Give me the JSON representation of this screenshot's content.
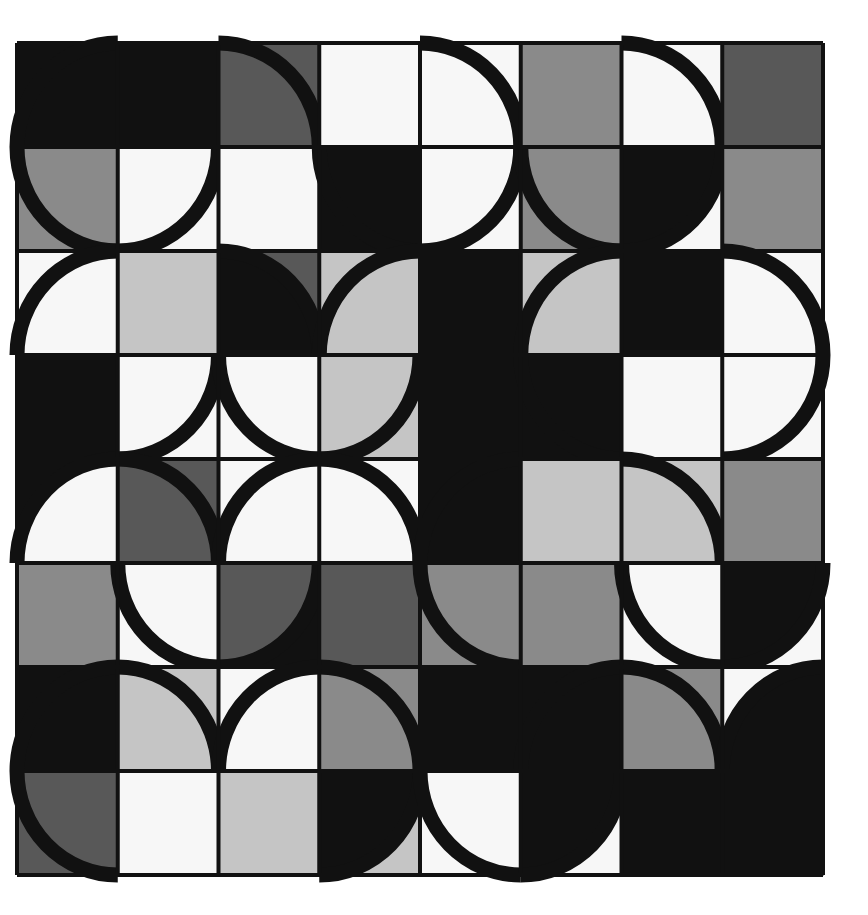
{
  "artwork": {
    "title": "Abstract Geometric Quarter-Circle Grid",
    "medium": "flat-color geometric composition",
    "canvas": {
      "width": 868,
      "height": 915,
      "background": "#ffffff"
    },
    "grid": {
      "origin_x": 17,
      "origin_y": 43,
      "width": 806,
      "height": 832,
      "cols": 8,
      "rows": 8,
      "cell_w": 100.75,
      "cell_h": 104.0
    },
    "stroke": {
      "color": "#111111",
      "width": 15,
      "gridline_color": "#111111",
      "gridline_width": 4
    },
    "palette": {
      "black": "#111111",
      "dark_gray": "#585858",
      "mid_gray": "#8a8a8a",
      "light_gray": "#c5c5c5",
      "pale": "#e9e9e9",
      "white": "#f7f7f7",
      "pure_white": "#ffffff"
    },
    "palette_names": [
      "black",
      "dark_gray",
      "mid_gray",
      "light_gray",
      "pale",
      "white"
    ],
    "legend": [
      {
        "swatch": "black",
        "hex": "#111111",
        "label": "Black"
      },
      {
        "swatch": "dark_gray",
        "hex": "#585858",
        "label": "Dark Gray"
      },
      {
        "swatch": "mid_gray",
        "hex": "#8a8a8a",
        "label": "Mid Gray"
      },
      {
        "swatch": "light_gray",
        "hex": "#c5c5c5",
        "label": "Light Gray"
      },
      {
        "swatch": "pale",
        "hex": "#e9e9e9",
        "label": "Pale Gray"
      },
      {
        "swatch": "white",
        "hex": "#f7f7f7",
        "label": "White"
      }
    ],
    "cells": [
      [
        {
          "bg": "black",
          "arc": "tl",
          "mode": "stroke"
        },
        {
          "bg": "black",
          "arc": "none",
          "mode": "none"
        },
        {
          "bg": "dark_gray",
          "arc": "tr",
          "mode": "stroke"
        },
        {
          "bg": "white",
          "arc": "none",
          "mode": "none"
        },
        {
          "bg": "white",
          "arc": "tr",
          "mode": "stroke"
        },
        {
          "bg": "mid_gray",
          "arc": "none",
          "mode": "none"
        },
        {
          "bg": "white",
          "arc": "tr",
          "mode": "stroke"
        },
        {
          "bg": "dark_gray",
          "arc": "none",
          "mode": "none"
        }
      ],
      [
        {
          "bg": "mid_gray",
          "arc": "bl",
          "mode": "stroke"
        },
        {
          "bg": "white",
          "arc": "br",
          "mode": "stroke"
        },
        {
          "bg": "white",
          "arc": "none",
          "mode": "none"
        },
        {
          "bg": "black",
          "arc": "bl",
          "mode": "stroke"
        },
        {
          "bg": "white",
          "arc": "br",
          "mode": "stroke"
        },
        {
          "bg": "mid_gray",
          "arc": "bl",
          "mode": "stroke"
        },
        {
          "bg": "black",
          "arc": "br",
          "mode": "fill_white"
        },
        {
          "bg": "mid_gray",
          "arc": "none",
          "mode": "none"
        }
      ],
      [
        {
          "bg": "white",
          "arc": "tl",
          "mode": "stroke"
        },
        {
          "bg": "light_gray",
          "arc": "none",
          "mode": "none"
        },
        {
          "bg": "black",
          "arc": "tr",
          "mode": "fill_dark"
        },
        {
          "bg": "light_gray",
          "arc": "tl",
          "mode": "stroke"
        },
        {
          "bg": "black",
          "arc": "none",
          "mode": "none"
        },
        {
          "bg": "light_gray",
          "arc": "tl",
          "mode": "stroke"
        },
        {
          "bg": "black",
          "arc": "none",
          "mode": "none"
        },
        {
          "bg": "white",
          "arc": "tr",
          "mode": "stroke"
        }
      ],
      [
        {
          "bg": "black",
          "arc": "none",
          "mode": "none"
        },
        {
          "bg": "white",
          "arc": "br",
          "mode": "stroke"
        },
        {
          "bg": "white",
          "arc": "bl",
          "mode": "stroke"
        },
        {
          "bg": "light_gray",
          "arc": "br",
          "mode": "stroke"
        },
        {
          "bg": "black",
          "arc": "none",
          "mode": "none"
        },
        {
          "bg": "black",
          "arc": "bl",
          "mode": "stroke"
        },
        {
          "bg": "white",
          "arc": "none",
          "mode": "none"
        },
        {
          "bg": "white",
          "arc": "br",
          "mode": "stroke"
        }
      ],
      [
        {
          "bg": "white",
          "arc": "tl",
          "mode": "fill_black"
        },
        {
          "bg": "dark_gray",
          "arc": "tr",
          "mode": "stroke"
        },
        {
          "bg": "white",
          "arc": "tl",
          "mode": "stroke"
        },
        {
          "bg": "white",
          "arc": "tr",
          "mode": "stroke"
        },
        {
          "bg": "black",
          "arc": "tl",
          "mode": "stroke"
        },
        {
          "bg": "light_gray",
          "arc": "none",
          "mode": "none"
        },
        {
          "bg": "light_gray",
          "arc": "tr",
          "mode": "stroke"
        },
        {
          "bg": "mid_gray",
          "arc": "none",
          "mode": "none"
        }
      ],
      [
        {
          "bg": "mid_gray",
          "arc": "none",
          "mode": "none"
        },
        {
          "bg": "white",
          "arc": "bl",
          "mode": "stroke"
        },
        {
          "bg": "dark_gray",
          "arc": "br",
          "mode": "fill_black"
        },
        {
          "bg": "dark_gray",
          "arc": "none",
          "mode": "none"
        },
        {
          "bg": "mid_gray",
          "arc": "bl",
          "mode": "stroke"
        },
        {
          "bg": "mid_gray",
          "arc": "none",
          "mode": "none"
        },
        {
          "bg": "white",
          "arc": "bl",
          "mode": "stroke"
        },
        {
          "bg": "black",
          "arc": "br",
          "mode": "fill_white"
        }
      ],
      [
        {
          "bg": "black",
          "arc": "tl",
          "mode": "stroke"
        },
        {
          "bg": "light_gray",
          "arc": "tr",
          "mode": "stroke"
        },
        {
          "bg": "white",
          "arc": "tl",
          "mode": "stroke"
        },
        {
          "bg": "mid_gray",
          "arc": "tr",
          "mode": "stroke"
        },
        {
          "bg": "black",
          "arc": "none",
          "mode": "none"
        },
        {
          "bg": "black",
          "arc": "tl",
          "mode": "stroke"
        },
        {
          "bg": "mid_gray",
          "arc": "tr",
          "mode": "stroke"
        },
        {
          "bg": "black",
          "arc": "tl",
          "mode": "fill_white"
        }
      ],
      [
        {
          "bg": "dark_gray",
          "arc": "bl",
          "mode": "stroke"
        },
        {
          "bg": "white",
          "arc": "none",
          "mode": "none"
        },
        {
          "bg": "light_gray",
          "arc": "none",
          "mode": "none"
        },
        {
          "bg": "black",
          "arc": "br",
          "mode": "fill_light"
        },
        {
          "bg": "white",
          "arc": "bl",
          "mode": "stroke"
        },
        {
          "bg": "black",
          "arc": "br",
          "mode": "fill_white"
        },
        {
          "bg": "black",
          "arc": "none",
          "mode": "none"
        },
        {
          "bg": "black",
          "arc": "none",
          "mode": "none"
        }
      ]
    ]
  }
}
